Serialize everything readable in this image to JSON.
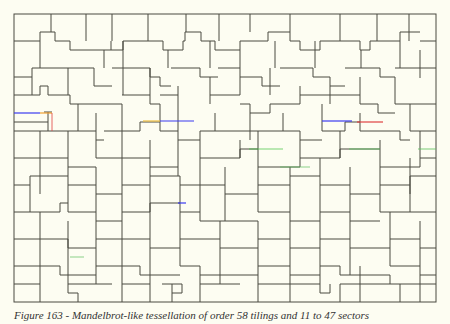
{
  "figure": {
    "frame": {
      "x": 14,
      "y": 14,
      "width": 422,
      "height": 288
    },
    "colors": {
      "background": "#fdfdf2",
      "line": "#4a4a40",
      "highlight_blue": "#3a3af0",
      "highlight_red": "#e04040",
      "highlight_orange": "#f0a030",
      "highlight_green": "#40c040"
    }
  },
  "caption": {
    "text": "Figure 163 - Mandelbrot-like tessellation of order 58 tilings and 11 to 47 sectors"
  }
}
